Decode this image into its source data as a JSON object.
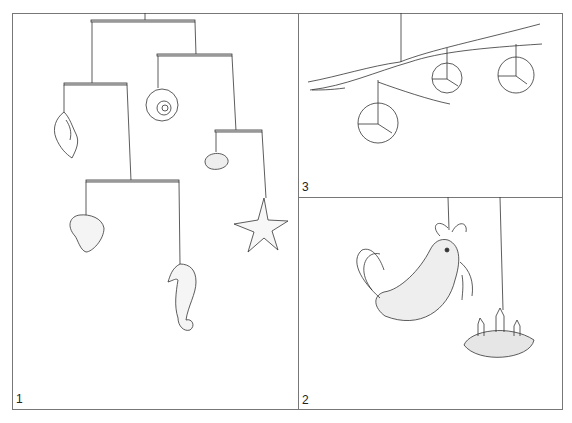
{
  "panels": [
    {
      "number": "1",
      "subject": "Mobile of shells and sea creatures",
      "items": [
        "whelk-shell",
        "moon-snail-shell",
        "cockle-shell",
        "scallop-shell",
        "seahorse",
        "starfish"
      ]
    },
    {
      "number": "2",
      "subject": "Mobile of bird and nest with chicks",
      "items": [
        "bird-with-worm",
        "nest-with-chicks"
      ]
    },
    {
      "number": "3",
      "subject": "Branch mobile with three balls",
      "items": [
        "ball-large",
        "ball-small",
        "ball-right"
      ]
    }
  ],
  "colors": {
    "line": "#333333",
    "frame": "#777777",
    "background": "#ffffff"
  }
}
